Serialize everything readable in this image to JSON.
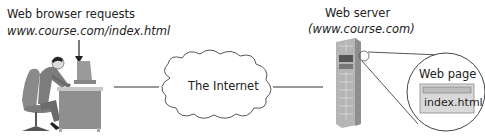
{
  "client": {
    "label": "Web browser requests",
    "url": "www.course.com/index.html"
  },
  "network": {
    "label": "The Internet"
  },
  "server": {
    "label": "Web server",
    "domain": "(www.course.com)"
  },
  "webpage": {
    "label": "Web page",
    "file": "index.html"
  },
  "colors": {
    "line": "#333333",
    "server_body": "#b9b9b9",
    "page_box": "#d8d8d8"
  }
}
